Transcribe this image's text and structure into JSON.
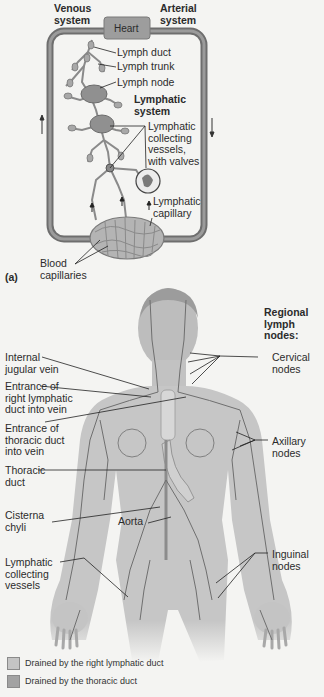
{
  "panel_a": {
    "panel_label": "(a)",
    "venous_system": "Venous\nsystem",
    "arterial_system": "Arterial\nsystem",
    "heart": "Heart",
    "lymph_duct": "Lymph duct",
    "lymph_trunk": "Lymph trunk",
    "lymph_node": "Lymph node",
    "lymphatic_system": "Lymphatic\nsystem",
    "collecting_vessels": "Lymphatic\ncollecting\nvessels,\nwith valves",
    "lymphatic_capillary": "Lymphatic\ncapillary",
    "blood_capillaries": "Blood\ncapillaries",
    "flow_arrows": [
      "up-arrow-left",
      "down-arrow-right"
    ]
  },
  "panel_b": {
    "regional_title": "Regional\nlymph\nnodes:",
    "left_labels": [
      "Internal\njugular vein",
      "Entrance of\nright lymphatic\nduct into vein",
      "Entrance of\nthoracic duct\ninto vein",
      "Thoracic\nduct",
      "Cisterna\nchyli",
      "Lymphatic\ncollecting\nvessels"
    ],
    "aorta": "Aorta",
    "right_labels": [
      "Cervical\nnodes",
      "Axillary\nnodes",
      "Inguinal\nnodes"
    ]
  },
  "legend": [
    {
      "label": "Drained by the right lymphatic duct",
      "color": "#c4c4c4"
    },
    {
      "label": "Drained by the thoracic duct",
      "color": "#a2a2a2"
    }
  ],
  "colors": {
    "background": "#f4f4f2",
    "loop": "#6e6e6e",
    "heart": "#9a9a9a",
    "body": "#c9c9c9",
    "vessels": "#707070"
  }
}
